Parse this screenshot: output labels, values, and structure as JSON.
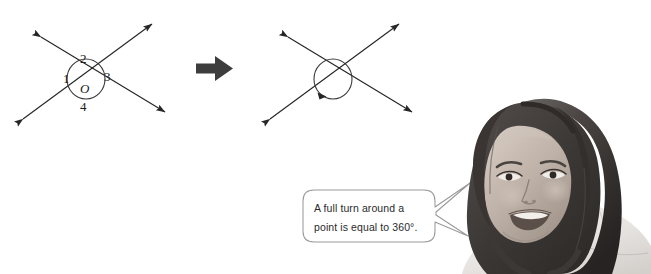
{
  "page": {
    "width": 651,
    "height": 274,
    "background": "#ffffff",
    "kind": "math-worksheet-illustration"
  },
  "diagram_left": {
    "name": "labelled-intersecting-lines",
    "description": "Two straight lines crossing at a point, circled, with four numbered angle regions",
    "center_label": "O",
    "angle_labels": [
      "1",
      "2",
      "3",
      "4"
    ],
    "label_1": "1",
    "label_2": "2",
    "label_3": "3",
    "label_4": "4",
    "stroke_color": "#262626",
    "circle_color": "#3a3a3a"
  },
  "transform_arrow": {
    "name": "rightwards-arrow",
    "direction": "right",
    "color": "#3d3d3d"
  },
  "diagram_right": {
    "name": "full-turn-intersecting-lines",
    "description": "Same two crossing lines circled, with a turn arrowhead on the circle",
    "stroke_color": "#262626",
    "circle_color": "#3a3a3a"
  },
  "speech_bubble": {
    "name": "full-turn-callout",
    "line_1": "A full turn around a",
    "line_2": "point is equal to 360°.",
    "text": "A full turn around a point is equal to 360°.",
    "border_color": "#9a9a9a",
    "fill_color": "#ffffff",
    "text_color": "#2a2a2a"
  },
  "photo": {
    "name": "student-portrait",
    "description": "Greyscale cut-out photograph of a smiling young woman with long dark hair wearing a light top",
    "tone": "grayscale"
  }
}
